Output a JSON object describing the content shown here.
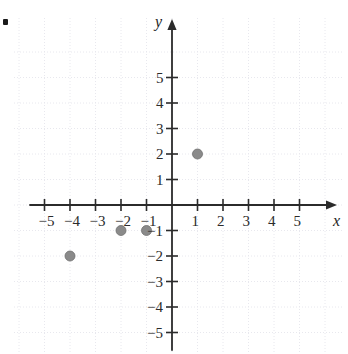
{
  "figure": {
    "kind": "coordinate-plane-scatter",
    "bullet_marker": "•",
    "background_color": "#ffffff"
  },
  "axes": {
    "x_label": "x",
    "y_label": "y",
    "axis_color": "#2b2b2b",
    "grid_color": "#e8e8ee",
    "grid_visible": true,
    "origin_px": {
      "x": 172,
      "y": 205
    },
    "unit_px": 25.5,
    "x_ticks": [
      {
        "value": -5,
        "label": "−5"
      },
      {
        "value": -4,
        "label": "−4"
      },
      {
        "value": -3,
        "label": "−3"
      },
      {
        "value": -2,
        "label": "−2"
      },
      {
        "value": -1,
        "label": "−1"
      },
      {
        "value": 1,
        "label": "1"
      },
      {
        "value": 2,
        "label": "2"
      },
      {
        "value": 3,
        "label": "3"
      },
      {
        "value": 4,
        "label": "4"
      },
      {
        "value": 5,
        "label": "5"
      }
    ],
    "y_ticks": [
      {
        "value": 5,
        "label": "5"
      },
      {
        "value": 4,
        "label": "4"
      },
      {
        "value": 3,
        "label": "3"
      },
      {
        "value": 2,
        "label": "2"
      },
      {
        "value": 1,
        "label": "1"
      },
      {
        "value": -1,
        "label": "−1"
      },
      {
        "value": -2,
        "label": "−2"
      },
      {
        "value": -3,
        "label": "−3"
      },
      {
        "value": -4,
        "label": "−4"
      },
      {
        "value": -5,
        "label": "−5"
      }
    ]
  },
  "chart_data": {
    "type": "scatter",
    "title": "",
    "xlabel": "x",
    "ylabel": "y",
    "xlim": [
      -6,
      6
    ],
    "ylim": [
      -6,
      6
    ],
    "grid": true,
    "legend": "none",
    "point_color": "#8a8a8a",
    "point_radius": 5,
    "series": [
      {
        "name": "plotted points",
        "points": [
          {
            "x": 1,
            "y": 2
          },
          {
            "x": -1,
            "y": -1
          },
          {
            "x": -2,
            "y": -1
          },
          {
            "x": -4,
            "y": -2
          }
        ]
      }
    ]
  }
}
